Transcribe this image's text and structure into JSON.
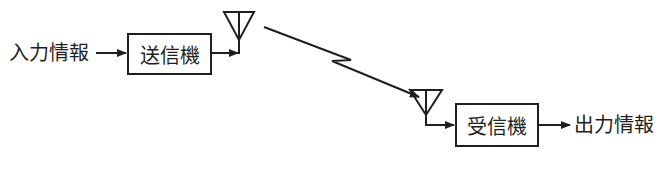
{
  "diagram": {
    "type": "block-diagram",
    "input_label": "入力情報",
    "transmitter": {
      "label": "送信機"
    },
    "receiver": {
      "label": "受信機"
    },
    "output_label": "出力情報",
    "link": "wireless (lightning arrow between antennas)",
    "colors": {
      "stroke": "#1f1f1f",
      "background": "#ffffff"
    }
  }
}
